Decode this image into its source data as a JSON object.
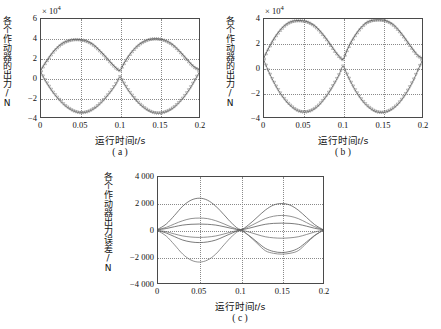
{
  "figure": {
    "panels": [
      {
        "id": "a",
        "caption": "( a )",
        "exponent_prefix": "× 10",
        "exponent_power": "4",
        "ylabel": "各个作动器的出力/N",
        "xlabel_cn": "运行时间",
        "xlabel_var": "t",
        "xlabel_unit": "/s",
        "yticks": [
          "6",
          "4",
          "2",
          "0",
          "−2",
          "−4"
        ],
        "xticks": [
          "0",
          "0.05",
          "0.1",
          "0.15",
          "0.2"
        ]
      },
      {
        "id": "b",
        "caption": "( b )",
        "exponent_prefix": "× 10",
        "exponent_power": "4",
        "ylabel": "各个作动器的出力/N",
        "xlabel_cn": "运行时间",
        "xlabel_var": "t",
        "xlabel_unit": "/s",
        "yticks": [
          "4",
          "2",
          "0",
          "−2",
          "−4"
        ],
        "xticks": [
          "0",
          "0.05",
          "0.1",
          "0.15",
          "0.2"
        ]
      },
      {
        "id": "c",
        "caption": "( c )",
        "exponent_prefix": "",
        "exponent_power": "",
        "ylabel": "各个作动器出力误差/N",
        "xlabel_cn": "运行时间",
        "xlabel_var": "t",
        "xlabel_unit": "/s",
        "yticks": [
          "4 000",
          "2 000",
          "0",
          "−2 000",
          "−4 000"
        ],
        "xticks": [
          "0",
          "0.05",
          "0.1",
          "0.15",
          "0.2"
        ]
      }
    ]
  },
  "colors": {
    "axis": "#4a4a4a",
    "grid": "#8a8a8a",
    "curve": "#6b6b6b",
    "curve_dark": "#4d4d4d",
    "marker": "#777777",
    "background": "#ffffff"
  },
  "chart_data": [
    {
      "type": "line",
      "panel": "a",
      "title": "",
      "xlabel": "运行时间 t/s",
      "ylabel": "各个作动器的出力/N",
      "y_exponent": 10000,
      "xlim": [
        0,
        0.2
      ],
      "ylim": [
        -4,
        6
      ],
      "xticks": [
        0,
        0.05,
        0.1,
        0.15,
        0.2
      ],
      "yticks": [
        -4,
        -2,
        0,
        2,
        4,
        6
      ],
      "grid": true,
      "legend": "none",
      "marker": "triangle",
      "series": [
        {
          "name": "作动器出力 1",
          "comment": "rises from ~0.8e4 to peak ~3.9e4 near t=0.05, back down through ~0.8e4 at t=0.1, second lobe peak ~4.0e4 near t=0.15, ends ~0.9e4",
          "x": [
            0,
            0.005,
            0.01,
            0.015,
            0.02,
            0.025,
            0.03,
            0.035,
            0.04,
            0.045,
            0.05,
            0.055,
            0.06,
            0.065,
            0.07,
            0.075,
            0.08,
            0.085,
            0.09,
            0.095,
            0.1,
            0.105,
            0.11,
            0.115,
            0.12,
            0.125,
            0.13,
            0.135,
            0.14,
            0.145,
            0.15,
            0.155,
            0.16,
            0.165,
            0.17,
            0.175,
            0.18,
            0.185,
            0.19,
            0.195,
            0.2
          ],
          "y": [
            0.8,
            1.45,
            2.05,
            2.6,
            3.05,
            3.4,
            3.65,
            3.8,
            3.9,
            3.92,
            3.9,
            3.82,
            3.68,
            3.45,
            3.12,
            2.72,
            2.3,
            1.85,
            1.4,
            1.0,
            0.75,
            1.45,
            2.1,
            2.65,
            3.1,
            3.45,
            3.7,
            3.88,
            3.97,
            4.0,
            3.97,
            3.88,
            3.72,
            3.48,
            3.15,
            2.75,
            2.3,
            1.85,
            1.4,
            1.05,
            0.85
          ]
        },
        {
          "name": "作动器出力 2",
          "comment": "mirror image, dips to ~-3.6e4 near t=0.05 and t=0.15",
          "x": [
            0,
            0.005,
            0.01,
            0.015,
            0.02,
            0.025,
            0.03,
            0.035,
            0.04,
            0.045,
            0.05,
            0.055,
            0.06,
            0.065,
            0.07,
            0.075,
            0.08,
            0.085,
            0.09,
            0.095,
            0.1,
            0.105,
            0.11,
            0.115,
            0.12,
            0.125,
            0.13,
            0.135,
            0.14,
            0.145,
            0.15,
            0.155,
            0.16,
            0.165,
            0.17,
            0.175,
            0.18,
            0.185,
            0.19,
            0.195,
            0.2
          ],
          "y": [
            0.55,
            -0.2,
            -0.85,
            -1.45,
            -1.95,
            -2.4,
            -2.8,
            -3.1,
            -3.35,
            -3.5,
            -3.58,
            -3.55,
            -3.45,
            -3.25,
            -2.98,
            -2.62,
            -2.2,
            -1.72,
            -1.2,
            -0.6,
            0.1,
            -0.55,
            -1.2,
            -1.75,
            -2.25,
            -2.68,
            -3.02,
            -3.3,
            -3.5,
            -3.6,
            -3.62,
            -3.55,
            -3.42,
            -3.2,
            -2.9,
            -2.5,
            -2.05,
            -1.5,
            -0.9,
            -0.2,
            0.5
          ]
        }
      ]
    },
    {
      "type": "line",
      "panel": "b",
      "title": "",
      "xlabel": "运行时间 t/s",
      "ylabel": "各个作动器的出力/N",
      "y_exponent": 10000,
      "xlim": [
        0,
        0.2
      ],
      "ylim": [
        -4,
        4
      ],
      "xticks": [
        0,
        0.05,
        0.1,
        0.15,
        0.2
      ],
      "yticks": [
        -4,
        -2,
        0,
        2,
        4
      ],
      "grid": true,
      "legend": "none",
      "marker": "triangle",
      "series": [
        {
          "name": "作动器出力 1",
          "comment": "peaks ~3.85e4 at t=0.05 and ~3.9e4 at t=0.15",
          "x": [
            0,
            0.005,
            0.01,
            0.015,
            0.02,
            0.025,
            0.03,
            0.035,
            0.04,
            0.045,
            0.05,
            0.055,
            0.06,
            0.065,
            0.07,
            0.075,
            0.08,
            0.085,
            0.09,
            0.095,
            0.1,
            0.105,
            0.11,
            0.115,
            0.12,
            0.125,
            0.13,
            0.135,
            0.14,
            0.145,
            0.15,
            0.155,
            0.16,
            0.165,
            0.17,
            0.175,
            0.18,
            0.185,
            0.19,
            0.195,
            0.2
          ],
          "y": [
            0.85,
            1.5,
            2.1,
            2.62,
            3.05,
            3.4,
            3.65,
            3.8,
            3.87,
            3.88,
            3.85,
            3.78,
            3.62,
            3.4,
            3.08,
            2.7,
            2.28,
            1.82,
            1.35,
            0.95,
            0.7,
            1.42,
            2.08,
            2.62,
            3.08,
            3.45,
            3.72,
            3.86,
            3.92,
            3.94,
            3.92,
            3.85,
            3.7,
            3.46,
            3.12,
            2.72,
            2.28,
            1.82,
            1.38,
            1.0,
            0.8
          ]
        },
        {
          "name": "作动器出力 2",
          "comment": "anti-phase, troughs ~-3.6e4",
          "x": [
            0,
            0.005,
            0.01,
            0.015,
            0.02,
            0.025,
            0.03,
            0.035,
            0.04,
            0.045,
            0.05,
            0.055,
            0.06,
            0.065,
            0.07,
            0.075,
            0.08,
            0.085,
            0.09,
            0.095,
            0.1,
            0.105,
            0.11,
            0.115,
            0.12,
            0.125,
            0.13,
            0.135,
            0.14,
            0.145,
            0.15,
            0.155,
            0.16,
            0.165,
            0.17,
            0.175,
            0.18,
            0.185,
            0.19,
            0.195,
            0.2
          ],
          "y": [
            0.6,
            -0.15,
            -0.85,
            -1.45,
            -2.0,
            -2.45,
            -2.85,
            -3.15,
            -3.4,
            -3.55,
            -3.6,
            -3.58,
            -3.48,
            -3.28,
            -3.0,
            -2.62,
            -2.2,
            -1.7,
            -1.15,
            -0.55,
            0.15,
            -0.5,
            -1.15,
            -1.75,
            -2.25,
            -2.7,
            -3.05,
            -3.32,
            -3.52,
            -3.62,
            -3.64,
            -3.58,
            -3.44,
            -3.22,
            -2.92,
            -2.52,
            -2.05,
            -1.5,
            -0.88,
            -0.15,
            0.55
          ]
        }
      ]
    },
    {
      "type": "line",
      "panel": "c",
      "title": "",
      "xlabel": "运行时间 t/s",
      "ylabel": "各个作动器出力误差/N",
      "y_exponent": 1,
      "xlim": [
        0,
        0.2
      ],
      "ylim": [
        -4000,
        4000
      ],
      "xticks": [
        0,
        0.05,
        0.1,
        0.15,
        0.2
      ],
      "yticks": [
        -4000,
        -2000,
        0,
        2000,
        4000
      ],
      "grid": true,
      "legend": "none",
      "marker": "none",
      "series": [
        {
          "name": "误差曲线 1",
          "comment": "largest positive lens: peak ~2400 at t=0.05, ~2000 at t=0.15",
          "x": [
            0,
            0.01,
            0.02,
            0.03,
            0.04,
            0.05,
            0.06,
            0.07,
            0.08,
            0.09,
            0.1,
            0.11,
            0.12,
            0.13,
            0.14,
            0.15,
            0.16,
            0.17,
            0.18,
            0.19,
            0.2
          ],
          "y": [
            60,
            450,
            1100,
            1800,
            2250,
            2400,
            2250,
            1800,
            1150,
            480,
            40,
            400,
            950,
            1500,
            1880,
            2000,
            1880,
            1500,
            950,
            400,
            30
          ]
        },
        {
          "name": "误差曲线 2",
          "comment": "mid positive lens: peak ~900 at t=0.05, ~1100 at t=0.15",
          "x": [
            0,
            0.01,
            0.02,
            0.03,
            0.04,
            0.05,
            0.06,
            0.07,
            0.08,
            0.09,
            0.1,
            0.11,
            0.12,
            0.13,
            0.14,
            0.15,
            0.16,
            0.17,
            0.18,
            0.19,
            0.2
          ],
          "y": [
            40,
            200,
            460,
            700,
            860,
            900,
            860,
            700,
            460,
            200,
            30,
            250,
            560,
            860,
            1040,
            1100,
            1040,
            860,
            560,
            250,
            25
          ]
        },
        {
          "name": "误差曲线 3",
          "comment": "small positive lens: peak ~450 at t=0.05, ~520 at t=0.15",
          "x": [
            0,
            0.01,
            0.02,
            0.03,
            0.04,
            0.05,
            0.06,
            0.07,
            0.08,
            0.09,
            0.1,
            0.11,
            0.12,
            0.13,
            0.14,
            0.15,
            0.16,
            0.17,
            0.18,
            0.19,
            0.2
          ],
          "y": [
            20,
            110,
            250,
            370,
            430,
            450,
            430,
            370,
            250,
            110,
            15,
            130,
            290,
            430,
            500,
            520,
            500,
            430,
            290,
            130,
            15
          ]
        },
        {
          "name": "误差曲线 4",
          "comment": "small negative lens: trough ~-560 at t=0.05, ~-620 at t=0.15",
          "x": [
            0,
            0.01,
            0.02,
            0.03,
            0.04,
            0.05,
            0.06,
            0.07,
            0.08,
            0.09,
            0.1,
            0.11,
            0.12,
            0.13,
            0.14,
            0.15,
            0.16,
            0.17,
            0.18,
            0.19,
            0.2
          ],
          "y": [
            -20,
            -130,
            -300,
            -450,
            -530,
            -560,
            -530,
            -450,
            -300,
            -130,
            -15,
            -150,
            -340,
            -510,
            -590,
            -620,
            -590,
            -510,
            -340,
            -150,
            -15
          ]
        },
        {
          "name": "误差曲线 5",
          "comment": "mid negative lens: trough ~-950 at t=0.05, ~-1700 at t=0.15",
          "x": [
            0,
            0.01,
            0.02,
            0.03,
            0.04,
            0.05,
            0.06,
            0.07,
            0.08,
            0.09,
            0.1,
            0.11,
            0.12,
            0.13,
            0.14,
            0.15,
            0.16,
            0.17,
            0.18,
            0.19,
            0.2
          ],
          "y": [
            -45,
            -230,
            -500,
            -760,
            -900,
            -950,
            -900,
            -760,
            -500,
            -230,
            -35,
            -400,
            -900,
            -1380,
            -1620,
            -1700,
            -1620,
            -1380,
            -900,
            -400,
            -30
          ]
        },
        {
          "name": "误差曲线 6",
          "comment": "largest negative lens: trough ~-2400 at t=0.05, ~-1800 at t=0.15",
          "x": [
            0,
            0.01,
            0.02,
            0.03,
            0.04,
            0.05,
            0.06,
            0.07,
            0.08,
            0.09,
            0.1,
            0.11,
            0.12,
            0.13,
            0.14,
            0.15,
            0.16,
            0.17,
            0.18,
            0.19,
            0.2
          ],
          "y": [
            -60,
            -460,
            -1120,
            -1820,
            -2270,
            -2420,
            -2270,
            -1820,
            -1120,
            -460,
            -40,
            -430,
            -1000,
            -1560,
            -1760,
            -1820,
            -1760,
            -1560,
            -1000,
            -430,
            -30
          ]
        }
      ]
    }
  ]
}
